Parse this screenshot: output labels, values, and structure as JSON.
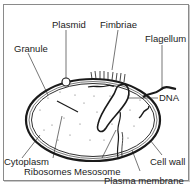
{
  "diagram": {
    "labels": {
      "plasmid": "Plasmid",
      "fimbriae": "Fimbriae",
      "flagellum": "Flagellum",
      "granule": "Granule",
      "dna": "DNA",
      "cytoplasm": "Cytoplasm",
      "ribosomes": "Ribosomes",
      "mesosome": "Mesosome",
      "cell_wall": "Cell wall",
      "plasma_membrane": "Plasma membrane"
    },
    "colors": {
      "line": "#1a1a1a",
      "frame": "#8a8a8a",
      "background": "#ffffff"
    }
  }
}
